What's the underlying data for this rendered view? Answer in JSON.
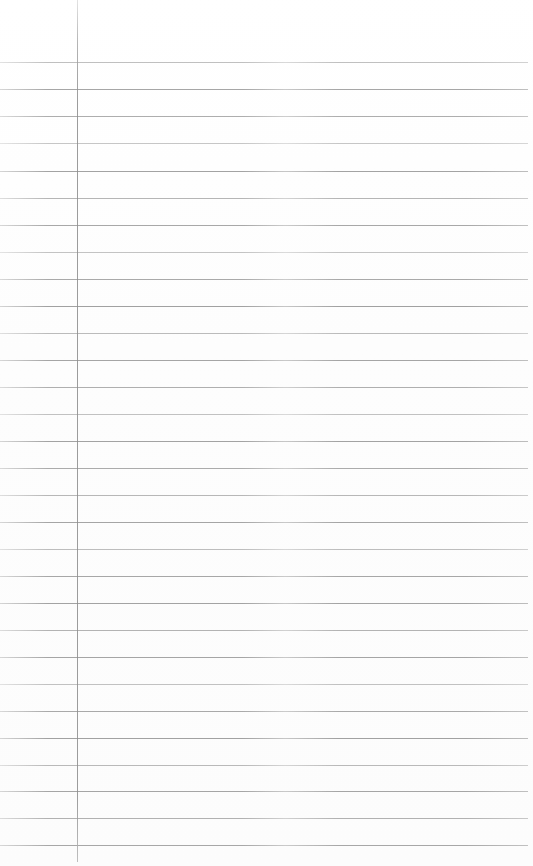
{
  "page": {
    "kind": "ruled-notebook-page",
    "width": 533,
    "height": 866,
    "background_color": "#fefefe",
    "content_text": "",
    "is_blank": true
  },
  "ruling": {
    "line_color": "#9a9a9a",
    "line_thickness_px": 1,
    "line_spacing_px": 27,
    "first_line_y": 62,
    "last_line_y": 845,
    "line_count": 30,
    "line_left_x": 0,
    "line_right_x": 528,
    "lines_y": [
      62,
      89,
      116,
      143,
      171,
      198,
      225,
      252,
      279,
      306,
      333,
      360,
      387,
      414,
      441,
      468,
      495,
      522,
      549,
      576,
      603,
      630,
      657,
      684,
      711,
      738,
      765,
      791,
      818,
      845
    ],
    "line_opacity": [
      0.62,
      0.88,
      0.8,
      0.55,
      0.9,
      0.72,
      0.86,
      0.58,
      0.84,
      0.92,
      0.66,
      0.88,
      0.78,
      0.6,
      0.9,
      0.82,
      0.7,
      0.88,
      0.64,
      0.86,
      0.9,
      0.74,
      0.88,
      0.6,
      0.84,
      0.92,
      0.68,
      0.88,
      0.76,
      0.86
    ]
  },
  "margin_rule": {
    "label": "left-margin-line",
    "color": "#8f8f8f",
    "thickness_px": 1,
    "x": 77,
    "top_y": 0,
    "bottom_y": 862
  },
  "regions": {
    "margin_column_label": "left margin column",
    "writing_area_label": "writing area",
    "header_area_label": "unruled header area"
  }
}
